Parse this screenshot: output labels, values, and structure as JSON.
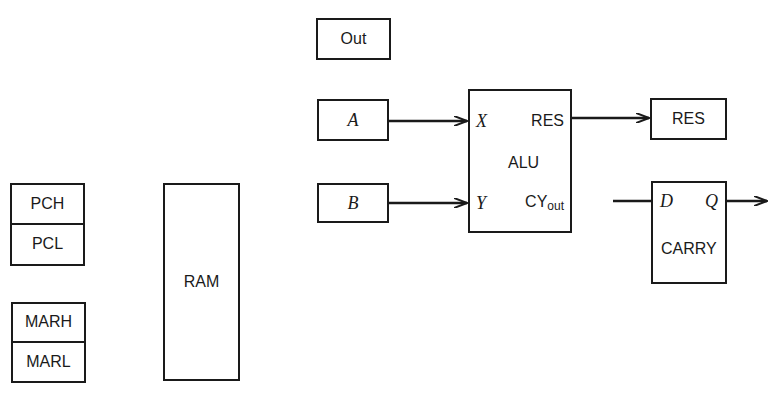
{
  "diagram": {
    "registers": {
      "pc": {
        "high": "PCH",
        "low": "PCL"
      },
      "mar": {
        "high": "MARH",
        "low": "MARL"
      },
      "ram": "RAM",
      "out": "Out",
      "a": "A",
      "b": "B",
      "res": "RES"
    },
    "alu": {
      "title": "ALU",
      "input_x": "X",
      "input_y": "Y",
      "output_res": "RES",
      "output_carry_main": "CY",
      "output_carry_sub": "out"
    },
    "carry_ff": {
      "title": "CARRY",
      "input_d": "D",
      "output_q": "Q"
    },
    "connections": [
      {
        "from": "A",
        "to": "ALU.X"
      },
      {
        "from": "B",
        "to": "ALU.Y"
      },
      {
        "from": "ALU.RES",
        "to": "RES"
      },
      {
        "from": "external",
        "to": "CARRY.D"
      },
      {
        "from": "CARRY.Q",
        "to": "external"
      }
    ],
    "colors": {
      "line": "#1a1a1a",
      "background": "#ffffff"
    }
  }
}
